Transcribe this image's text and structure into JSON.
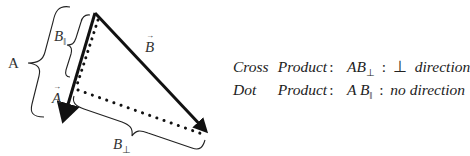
{
  "diagram": {
    "labels": {
      "a_magnitude": "A",
      "b_parallel_base": "B",
      "b_parallel_sub": "‖",
      "vec_a": "A",
      "vec_b": "B",
      "b_perp_base": "B",
      "b_perp_sub": "⊥"
    },
    "colors": {
      "vector": "#111111",
      "brace": "#222222",
      "dotted": "#111111"
    }
  },
  "formulas": [
    {
      "word1": "Cross",
      "word2": "Product",
      "colon": ":",
      "term_base": "AB",
      "term_sub": "⊥",
      "colon2": ":",
      "result_symbol": "⊥",
      "result_text": "direction"
    },
    {
      "word1": "Dot",
      "word2": "Product",
      "colon": ":",
      "term_base": "A B",
      "term_sub": "‖",
      "colon2": ":",
      "result_symbol": "",
      "result_text": "no direction"
    }
  ]
}
